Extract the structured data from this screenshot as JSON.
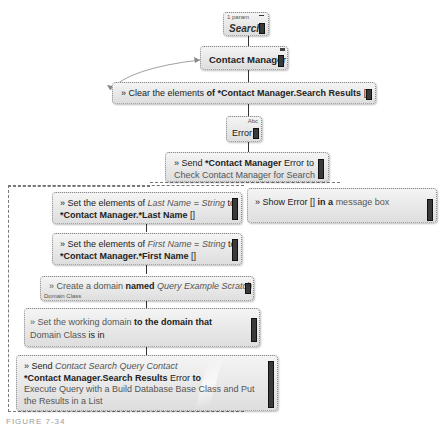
{
  "nodes": {
    "search": {
      "param_label": "1 param",
      "title": "Search"
    },
    "contact_manager": {
      "title": "Contact Manager"
    },
    "clear": {
      "prefix": "» Clear the elements",
      "of": "of",
      "target": "*Contact Manager.Search Results",
      "box": "[]"
    },
    "error": {
      "type_label": "Abc",
      "title": "Error"
    },
    "send_error": {
      "prefix": "» Send",
      "target": "*Contact Manager",
      "value": "Error",
      "to": "to",
      "message": "Check Contact Manager for Search"
    },
    "set_last": {
      "prefix": "» Set the elements of",
      "var": "Last Name",
      "eq": "=",
      "type": "String",
      "to": "to",
      "target": "*Contact Manager.*Last Name",
      "box": "[]"
    },
    "show_error": {
      "prefix": "» Show",
      "value": "Error",
      "box": "[]",
      "in_a": "in a",
      "where": "message box"
    },
    "set_first": {
      "prefix": "» Set the elements of",
      "var": "First Name",
      "eq": "=",
      "type": "String",
      "to": "to",
      "target": "*Contact Manager.*First Name",
      "box": "[]"
    },
    "create_domain": {
      "prefix": "» Create a domain",
      "named": "named",
      "name": "Query Example Scratch",
      "sub": "Domain Class"
    },
    "set_working": {
      "prefix": "» Set the working domain",
      "mid": "to the domain that",
      "value": "Domain Class",
      "end": "is in"
    },
    "send_query": {
      "prefix": "» Send",
      "query": "Contact Search Query Contact",
      "target": "*Contact Manager.Search Results",
      "value": "Error",
      "to": "to",
      "message": "Execute Query with a Build Database Base Class and Put the Results in a List"
    }
  },
  "caption": "FIGURE 7-34"
}
